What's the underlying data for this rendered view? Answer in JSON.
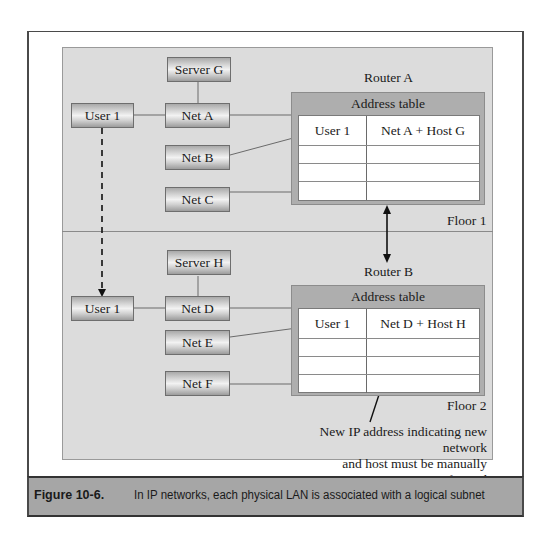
{
  "figure": {
    "number": "Figure 10-6.",
    "caption": "In IP networks, each physical LAN is associated with a logical subnet"
  },
  "floor1": {
    "label": "Floor 1",
    "server": "Server G",
    "user": "User 1",
    "nets": [
      "Net A",
      "Net B",
      "Net C"
    ],
    "router": {
      "name": "Router A",
      "table_title": "Address table",
      "rows": [
        {
          "user": "User 1",
          "address": "Net A + Host G"
        },
        {
          "user": "",
          "address": ""
        },
        {
          "user": "",
          "address": ""
        },
        {
          "user": "",
          "address": ""
        }
      ]
    }
  },
  "floor2": {
    "label": "Floor 2",
    "server": "Server H",
    "user": "User 1",
    "nets": [
      "Net D",
      "Net E",
      "Net F"
    ],
    "router": {
      "name": "Router B",
      "table_title": "Address table",
      "rows": [
        {
          "user": "User 1",
          "address": "Net D + Host H"
        },
        {
          "user": "",
          "address": ""
        },
        {
          "user": "",
          "address": ""
        },
        {
          "user": "",
          "address": ""
        }
      ]
    }
  },
  "annotation": {
    "line1": "New IP address indicating new network",
    "line2": "and host must be manually reconfigured"
  }
}
